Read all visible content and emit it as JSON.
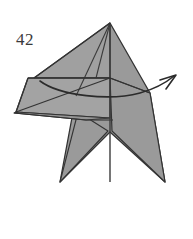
{
  "figure": {
    "type": "origami-diagram",
    "step_number": "42",
    "background_color": "#ffffff",
    "paper_fill_color": "#9a9a9a",
    "paper_fill_light": "#a8a8a8",
    "paper_fill_dark": "#8e8e8e",
    "crease_line_color": "#3b3b3b",
    "outline_color": "#333333",
    "arrow_color": "#2b2b2b",
    "label_color": "#3a3a3a"
  },
  "shapes": {
    "star_body": {
      "name": "five-point-star-base",
      "points": "110,23 150,93 165,182 110,132 60,182 76,96"
    },
    "upper_left_flap": {
      "name": "upper-left-triangle-flap",
      "points": "110,23 34,78 110,78"
    },
    "left_wing_upper": {
      "name": "left-wing-upper",
      "points": "28,78 110,78 110,118 16,112"
    },
    "left_wing_lower": {
      "name": "left-wing-lower",
      "points": "16,112 110,118 86,120 14,113"
    },
    "right_arm": {
      "name": "right-arm",
      "points": "110,78 150,93 165,182 112,131"
    },
    "lower_left_arm": {
      "name": "lower-left-arm",
      "points": "108,131 60,182 78,112"
    }
  },
  "creases": [
    {
      "name": "center-vertical-crease",
      "path": "M110,23 L110,182"
    },
    {
      "name": "left-apex-crease",
      "path": "M110,23 L76,96"
    },
    {
      "name": "inner-left-crease",
      "path": "M110,23 L96,78"
    },
    {
      "name": "flap-edge-crease",
      "path": "M110,23 L34,78"
    },
    {
      "name": "horizontal-left-crease",
      "path": "M28,78 L110,78"
    },
    {
      "name": "flap-lower-crease",
      "path": "M16,112 L110,78"
    },
    {
      "name": "flap-bottom-crease",
      "path": "M14,113 L86,120"
    },
    {
      "name": "wing-tip-crease",
      "path": "M28,78 L16,112"
    },
    {
      "name": "mid-horizontal-crease",
      "path": "M86,120 L113,120"
    },
    {
      "name": "right-shoulder-crease",
      "path": "M110,78 L150,93"
    }
  ],
  "arrow": {
    "name": "fold-direction-arrow",
    "description": "curved arrow sweeping from left edge to upper right",
    "path": "M40,81 C60,96 110,101 140,93 C158,88 168,81 174,76",
    "head_path": "M160,80 L176,75 L166,89"
  },
  "labels": {
    "step": "42"
  }
}
